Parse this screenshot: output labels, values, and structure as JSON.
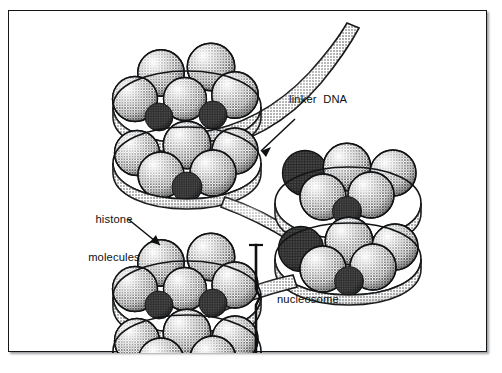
{
  "figure": {
    "domain": "diagram",
    "background_color": "#ffffff",
    "frame": {
      "border_color": "#14171a",
      "border_width_px": 1.4,
      "shadow": "drop shadow lower-right",
      "x": 8,
      "y": 10,
      "width": 479,
      "height": 342
    }
  },
  "labels": [
    {
      "name": "linker-dna",
      "text": "linker  DNA",
      "x": 288,
      "y": 92,
      "align": "left",
      "arrow": {
        "from": [
          291,
          116
        ],
        "to": [
          255,
          150
        ],
        "head": "to"
      }
    },
    {
      "name": "histone-molecules",
      "line1": "histone",
      "line2": "molecules",
      "x": 97,
      "y": 187,
      "align": "center",
      "arrow": {
        "from": [
          132,
          216
        ],
        "to": [
          160,
          243
        ],
        "head": "to"
      }
    },
    {
      "name": "nucleosome",
      "text": "nucleosome",
      "x": 276,
      "y": 292,
      "align": "left",
      "bracket": {
        "x": 256,
        "y_top": 243,
        "y_bottom": 355
      }
    }
  ],
  "nucleosomes": [
    {
      "id": 1,
      "cx": 186,
      "cy": 98,
      "label": "top-left nucleosome",
      "histone_count": 8,
      "tiers": 2
    },
    {
      "id": 2,
      "cx": 322,
      "cy": 198,
      "label": "middle-right nucleosome",
      "histone_count": 8,
      "tiers": 2
    },
    {
      "id": 3,
      "cx": 186,
      "cy": 292,
      "label": "bottom-left nucleosome",
      "histone_count": 8,
      "tiers": 2
    }
  ],
  "dna": {
    "ribbon_fill": "#b9b9b9",
    "ribbon_stroke": "#131517",
    "segments": [
      {
        "name": "free-end-upper-right",
        "desc": "DNA ribbon exits nucleosome 1 top-right and curves up toward upper right corner"
      },
      {
        "name": "linker-1-2",
        "desc": "linker DNA descends right from nucleosome 1 to nucleosome 2"
      },
      {
        "name": "linker-2-3",
        "desc": "linker DNA descends left from nucleosome 2 to nucleosome 3"
      }
    ],
    "wraps_per_nucleosome": 2
  },
  "histone": {
    "shading": "halftone stipple, highlight upper-left, shadow lower-right",
    "fill_light": "#e9e9e9",
    "fill_mid": "#9a9a9a",
    "fill_dark": "#2b2b2b",
    "stroke": "#101214"
  }
}
